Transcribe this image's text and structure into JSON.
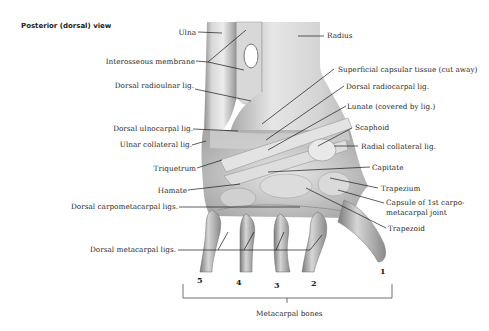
{
  "figure": {
    "title": "Posterior (dorsal) view",
    "left_labels": [
      {
        "id": "ulna",
        "text": "Ulna"
      },
      {
        "id": "interosseous-membrane",
        "text": "Interosseous membrane"
      },
      {
        "id": "dorsal-radioulnar-lig",
        "text": "Dorsal radioulnar lig."
      },
      {
        "id": "dorsal-ulnocarpal-lig",
        "text": "Dorsal ulnocarpal lig."
      },
      {
        "id": "ulnar-collateral-lig",
        "text": "Ulnar collateral lig."
      },
      {
        "id": "triquetrum",
        "text": "Triquetrum"
      },
      {
        "id": "hamate",
        "text": "Hamate"
      },
      {
        "id": "dorsal-carpometacarpal-ligs",
        "text": "Dorsal carpometacarpal ligs."
      },
      {
        "id": "dorsal-metacarpal-ligs",
        "text": "Dorsal metacarpal ligs."
      }
    ],
    "right_labels": [
      {
        "id": "radius",
        "text": "Radius"
      },
      {
        "id": "superficial-capsular-tissue",
        "text": "Superficial capsular tissue (cut away)"
      },
      {
        "id": "dorsal-radiocarpal-lig",
        "text": "Dorsal radiocarpal lig."
      },
      {
        "id": "lunate",
        "text": "Lunate (covered by lig.)"
      },
      {
        "id": "scaphoid",
        "text": "Scaphoid"
      },
      {
        "id": "radial-collateral-lig",
        "text": "Radial collateral lig."
      },
      {
        "id": "capitate",
        "text": "Capitate"
      },
      {
        "id": "trapezium",
        "text": "Trapezium"
      },
      {
        "id": "capsule-1st-cmc-line1",
        "text": "Capsule of 1st carpo-"
      },
      {
        "id": "capsule-1st-cmc-line2",
        "text": "metacarpal joint"
      },
      {
        "id": "trapezoid",
        "text": "Trapezoid"
      }
    ],
    "metacarpal_numbers": [
      "5",
      "4",
      "3",
      "2",
      "1"
    ],
    "bracket_label": "Metacarpal bones"
  }
}
